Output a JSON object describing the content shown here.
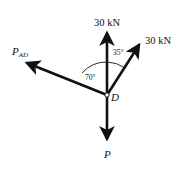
{
  "diagram": {
    "type": "free-body-diagram",
    "node": {
      "label": "D",
      "x": 107,
      "y": 95
    },
    "forces": [
      {
        "id": "up",
        "label": "30 kN",
        "direction_deg": 90
      },
      {
        "id": "upright",
        "label": "30 kN",
        "angle_from_vertical_deg": 35
      },
      {
        "id": "left",
        "label_main": "P",
        "label_sub": "AD",
        "angle_from_vertical_deg": 70
      },
      {
        "id": "down",
        "label": "P",
        "direction_deg": 270
      }
    ],
    "angles": [
      {
        "label": "70°"
      },
      {
        "label": "35°"
      }
    ],
    "colors": {
      "stroke": "#111111",
      "background": "#ffffff"
    }
  }
}
